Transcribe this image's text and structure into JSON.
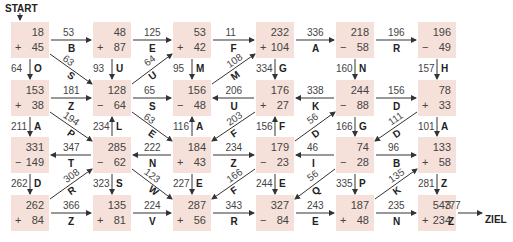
{
  "start_label": "START",
  "end_label": "ZIEL",
  "colors": {
    "cell_bg": "#f6e1da",
    "arrow": "#333333"
  },
  "cells": [
    {
      "id": "r1c1",
      "top": "18",
      "op": "+",
      "bottom": "45"
    },
    {
      "id": "r1c2",
      "top": "48",
      "op": "+",
      "bottom": "87"
    },
    {
      "id": "r1c3",
      "top": "53",
      "op": "+",
      "bottom": "42"
    },
    {
      "id": "r1c4",
      "top": "232",
      "op": "+",
      "bottom": "104"
    },
    {
      "id": "r1c5",
      "top": "218",
      "op": "−",
      "bottom": "58"
    },
    {
      "id": "r1c6",
      "top": "196",
      "op": "−",
      "bottom": "49"
    },
    {
      "id": "r2c1",
      "top": "153",
      "op": "+",
      "bottom": "38"
    },
    {
      "id": "r2c2",
      "top": "128",
      "op": "−",
      "bottom": "64"
    },
    {
      "id": "r2c3",
      "top": "156",
      "op": "−",
      "bottom": "48"
    },
    {
      "id": "r2c4",
      "top": "176",
      "op": "+",
      "bottom": "27"
    },
    {
      "id": "r2c5",
      "top": "244",
      "op": "−",
      "bottom": "88"
    },
    {
      "id": "r2c6",
      "top": "78",
      "op": "+",
      "bottom": "33"
    },
    {
      "id": "r3c1",
      "top": "331",
      "op": "−",
      "bottom": "149"
    },
    {
      "id": "r3c2",
      "top": "285",
      "op": "−",
      "bottom": "62"
    },
    {
      "id": "r3c3",
      "top": "184",
      "op": "+",
      "bottom": "43"
    },
    {
      "id": "r3c4",
      "top": "179",
      "op": "−",
      "bottom": "23"
    },
    {
      "id": "r3c5",
      "top": "74",
      "op": "−",
      "bottom": "28"
    },
    {
      "id": "r3c6",
      "top": "133",
      "op": "+",
      "bottom": "58"
    },
    {
      "id": "r4c1",
      "top": "262",
      "op": "+",
      "bottom": "84"
    },
    {
      "id": "r4c2",
      "top": "135",
      "op": "+",
      "bottom": "81"
    },
    {
      "id": "r4c3",
      "top": "287",
      "op": "+",
      "bottom": "56"
    },
    {
      "id": "r4c4",
      "top": "327",
      "op": "−",
      "bottom": "84"
    },
    {
      "id": "r4c5",
      "top": "187",
      "op": "+",
      "bottom": "48"
    },
    {
      "id": "r4c6",
      "top": "543",
      "op": "+",
      "bottom": "234"
    }
  ],
  "arrows": [
    {
      "from": "r1c1",
      "to": "r1c2",
      "value": "53",
      "letter": "B"
    },
    {
      "from": "r1c2",
      "to": "r1c3",
      "value": "125",
      "letter": "E"
    },
    {
      "from": "r1c3",
      "to": "r1c4",
      "value": "11",
      "letter": "F"
    },
    {
      "from": "r1c4",
      "to": "r1c5",
      "value": "336",
      "letter": "A"
    },
    {
      "from": "r1c5",
      "to": "r1c6",
      "value": "196",
      "letter": "R"
    },
    {
      "from": "r1c1",
      "to": "r2c1",
      "value": "64",
      "letter": "O"
    },
    {
      "from": "r1c1",
      "to": "r2c2",
      "value": "63",
      "letter": "S"
    },
    {
      "from": "r1c2",
      "to": "r2c2",
      "value": "93",
      "letter": "U"
    },
    {
      "from": "r2c2",
      "to": "r1c3",
      "value": "64",
      "letter": "U"
    },
    {
      "from": "r1c3",
      "to": "r2c3",
      "value": "95",
      "letter": "M"
    },
    {
      "from": "r2c3",
      "to": "r1c4",
      "value": "108",
      "letter": "M"
    },
    {
      "from": "r1c4",
      "to": "r2c4",
      "value": "334",
      "letter": "G"
    },
    {
      "from": "r1c5",
      "to": "r2c5",
      "value": "160",
      "letter": "N"
    },
    {
      "from": "r1c6",
      "to": "r2c6",
      "value": "157",
      "letter": "H"
    },
    {
      "from": "r2c1",
      "to": "r2c2",
      "value": "181",
      "letter": "Z"
    },
    {
      "from": "r2c2",
      "to": "r2c3",
      "value": "65",
      "letter": "S"
    },
    {
      "from": "r2c4",
      "to": "r2c3",
      "value": "206",
      "letter": "U"
    },
    {
      "from": "r2c5",
      "to": "r2c4",
      "value": "338",
      "letter": "K"
    },
    {
      "from": "r2c5",
      "to": "r2c6",
      "value": "156",
      "letter": "D"
    },
    {
      "from": "r2c1",
      "to": "r3c1",
      "value": "211",
      "letter": "A"
    },
    {
      "from": "r2c1",
      "to": "r3c2",
      "value": "194",
      "letter": "P"
    },
    {
      "from": "r3c2",
      "to": "r2c2",
      "value": "234",
      "letter": "L"
    },
    {
      "from": "r2c2",
      "to": "r3c3",
      "value": "63",
      "letter": "E"
    },
    {
      "from": "r3c3",
      "to": "r2c3",
      "value": "116",
      "letter": "A"
    },
    {
      "from": "r2c4",
      "to": "r3c3",
      "value": "203",
      "letter": "F"
    },
    {
      "from": "r3c4",
      "to": "r2c4",
      "value": "156",
      "letter": "F"
    },
    {
      "from": "r3c4",
      "to": "r2c5",
      "value": "56",
      "letter": "D"
    },
    {
      "from": "r2c5",
      "to": "r3c5",
      "value": "166",
      "letter": "G"
    },
    {
      "from": "r2c6",
      "to": "r3c5",
      "value": "111",
      "letter": "D"
    },
    {
      "from": "r2c6",
      "to": "r3c6",
      "value": "101",
      "letter": "A"
    },
    {
      "from": "r3c2",
      "to": "r3c1",
      "value": "347",
      "letter": "T"
    },
    {
      "from": "r3c3",
      "to": "r3c2",
      "value": "222",
      "letter": "N"
    },
    {
      "from": "r3c3",
      "to": "r3c4",
      "value": "234",
      "letter": "Z"
    },
    {
      "from": "r3c5",
      "to": "r3c4",
      "value": "46",
      "letter": "I"
    },
    {
      "from": "r3c5",
      "to": "r3c6",
      "value": "96",
      "letter": "B"
    },
    {
      "from": "r3c1",
      "to": "r4c1",
      "value": "262",
      "letter": "D"
    },
    {
      "from": "r4c1",
      "to": "r3c2",
      "value": "308",
      "letter": "R"
    },
    {
      "from": "r3c2",
      "to": "r4c2",
      "value": "323",
      "letter": "S"
    },
    {
      "from": "r3c2",
      "to": "r4c3",
      "value": "123",
      "letter": "W"
    },
    {
      "from": "r3c3",
      "to": "r4c3",
      "value": "227",
      "letter": "E"
    },
    {
      "from": "r3c4",
      "to": "r4c3",
      "value": "166",
      "letter": "F"
    },
    {
      "from": "r3c4",
      "to": "r4c4",
      "value": "244",
      "letter": "E"
    },
    {
      "from": "r3c5",
      "to": "r4c4",
      "value": "56",
      "letter": "Q"
    },
    {
      "from": "r3c5",
      "to": "r4c5",
      "value": "335",
      "letter": "P"
    },
    {
      "from": "r4c5",
      "to": "r3c6",
      "value": "135",
      "letter": "K"
    },
    {
      "from": "r3c6",
      "to": "r4c6",
      "value": "281",
      "letter": "Z"
    },
    {
      "from": "r4c1",
      "to": "r4c2",
      "value": "366",
      "letter": "Z"
    },
    {
      "from": "r4c2",
      "to": "r4c3",
      "value": "224",
      "letter": "V"
    },
    {
      "from": "r4c3",
      "to": "r4c4",
      "value": "343",
      "letter": "R"
    },
    {
      "from": "r4c4",
      "to": "r4c5",
      "value": "243",
      "letter": "E"
    },
    {
      "from": "r4c5",
      "to": "r4c6",
      "value": "235",
      "letter": "N"
    },
    {
      "from": "r4c6",
      "to": "ZIEL",
      "value": "777",
      "letter": "Z"
    }
  ]
}
